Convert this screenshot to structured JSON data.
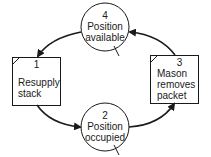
{
  "diagram": {
    "type": "cycle",
    "colors": {
      "stroke": "#1a1a1a",
      "background": "#ffffff"
    },
    "nodes": [
      {
        "id": "1",
        "shape": "box",
        "number": "1",
        "label_line1": "Resupply",
        "label_line2": "stack",
        "label_line3": ""
      },
      {
        "id": "2",
        "shape": "circle",
        "number": "2",
        "label_line1": "Position",
        "label_line2": "occupied"
      },
      {
        "id": "3",
        "shape": "box",
        "number": "3",
        "label_line1": "Mason",
        "label_line2": "removes",
        "label_line3": "packet"
      },
      {
        "id": "4",
        "shape": "circle",
        "number": "4",
        "label_line1": "Position",
        "label_line2": "available"
      }
    ],
    "edges": [
      {
        "from": "1",
        "to": "2"
      },
      {
        "from": "2",
        "to": "3"
      },
      {
        "from": "3",
        "to": "4"
      },
      {
        "from": "4",
        "to": "1"
      }
    ]
  }
}
